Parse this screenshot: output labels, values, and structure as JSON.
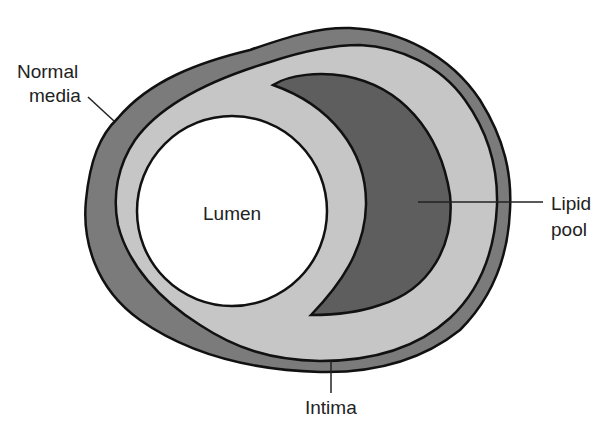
{
  "diagram": {
    "type": "cross-section of atherosclerotic artery",
    "labels": {
      "normal_media_line1": "Normal",
      "normal_media_line2": "media",
      "lumen": "Lumen",
      "lipid_pool_line1": "Lipid",
      "lipid_pool_line2": "pool",
      "intima": "Intima"
    },
    "colors": {
      "media": "#7b7b7b",
      "intima": "#c6c6c6",
      "lipid_pool": "#5e5e5e",
      "lumen": "#ffffff",
      "outline": "#111111"
    }
  }
}
